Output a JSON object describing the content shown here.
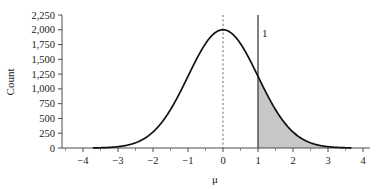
{
  "chart_data": {
    "type": "line",
    "title": "",
    "xlabel": "μ",
    "ylabel": "Count",
    "xlim": [
      -4.6,
      4.2
    ],
    "ylim": [
      0,
      2250
    ],
    "grid": false,
    "legend": null,
    "x_ticks": [
      -4,
      -3,
      -2,
      -1,
      0,
      1,
      2,
      3,
      4
    ],
    "x_tick_labels": [
      "−4",
      "−3",
      "−2",
      "−1",
      "0",
      "1",
      "2",
      "3",
      "4"
    ],
    "x_minor_ticks": [
      -4.5,
      -3.5,
      -2.5,
      -1.5,
      -0.5,
      0.5,
      1.5,
      2.5,
      3.5
    ],
    "y_ticks": [
      0,
      250,
      500,
      750,
      1000,
      1250,
      1500,
      1750,
      2000,
      2250
    ],
    "y_tick_labels": [
      "0",
      "250",
      "500",
      "750",
      "1,000",
      "1,250",
      "1,500",
      "1,750",
      "2,000",
      "2,250"
    ],
    "series": [
      {
        "name": "Sampling distribution of the mean",
        "curve": "normal",
        "peak_value": 2000,
        "mean": 0,
        "sd": 1,
        "x_start": -3.7,
        "x_end": 3.65,
        "color": "#111111"
      }
    ],
    "shaded_region": {
      "label": "upper tail",
      "x_from": 1,
      "x_to": 3.65,
      "fill_color": "#c8c8c8"
    },
    "reference_lines": [
      {
        "name": "critical-value-line",
        "x": 1,
        "style": "solid",
        "label": "1",
        "y_top": 2250,
        "color": "#4a4a4a"
      },
      {
        "name": "mean-line",
        "x": 0,
        "style": "dashed",
        "label": "",
        "y_top": 2250,
        "color": "#555555"
      }
    ],
    "key_points": [
      {
        "x": -3.0,
        "y": 22
      },
      {
        "x": -2.0,
        "y": 271
      },
      {
        "x": -1.0,
        "y": 1213
      },
      {
        "x": 0.0,
        "y": 2000
      },
      {
        "x": 1.0,
        "y": 1213
      },
      {
        "x": 2.0,
        "y": 271
      },
      {
        "x": 3.0,
        "y": 22
      }
    ]
  }
}
